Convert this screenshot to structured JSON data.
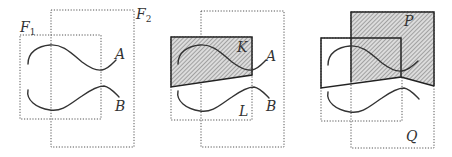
{
  "figure": {
    "panels": [
      {
        "id": "panel-1",
        "labels": {
          "frame1": "F",
          "frame1_sub": "1",
          "frame2": "F",
          "frame2_sub": "2",
          "curve_a": "A",
          "curve_b": "B"
        }
      },
      {
        "id": "panel-2",
        "labels": {
          "region_k": "K",
          "region_l": "L",
          "curve_a": "A",
          "curve_b": "B"
        }
      },
      {
        "id": "panel-3",
        "labels": {
          "region_p": "P",
          "region_q": "Q"
        }
      }
    ],
    "colors": {
      "stroke": "#333333",
      "dotted_frame": "#555555",
      "hatch_fill": "#d9d9d9",
      "hatch_line": "#555555",
      "background": "#ffffff"
    }
  }
}
